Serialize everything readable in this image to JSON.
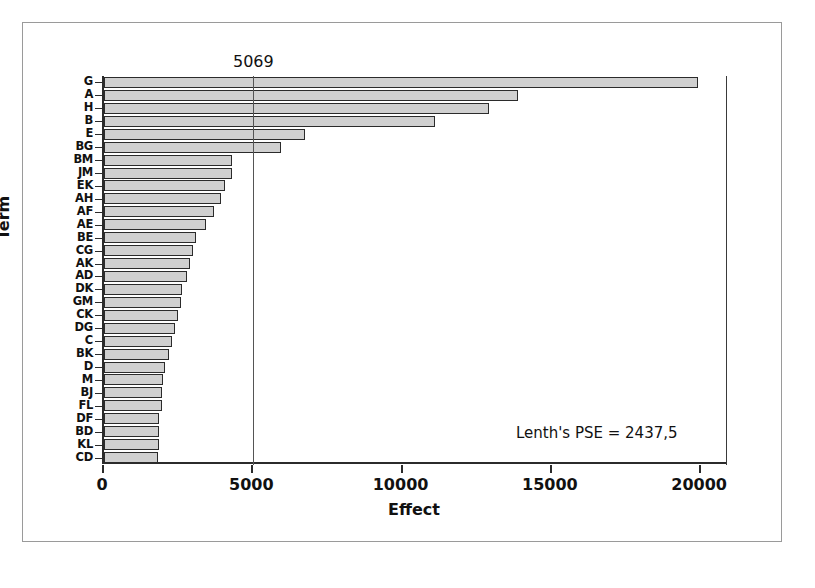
{
  "figure": {
    "x_axis_title": "Effect",
    "y_axis_title": "Term",
    "reference_line_label": "5069",
    "pse_annotation": "Lenth's PSE = 2437,5"
  },
  "chart_data": {
    "type": "bar",
    "orientation": "horizontal",
    "title": "",
    "xlabel": "Effect",
    "ylabel": "Term",
    "xlim": [
      0,
      20900
    ],
    "xticks": [
      0,
      5000,
      10000,
      15000,
      20000
    ],
    "xtick_labels": [
      "0",
      "5000",
      "10000",
      "15000",
      "20000"
    ],
    "grid": false,
    "legend": null,
    "reference_line": {
      "value": 5069,
      "label": "5069",
      "orientation": "vertical"
    },
    "annotations": [
      {
        "text": "Lenth's PSE = 2437,5",
        "x": 15000,
        "y": "bottom-right"
      }
    ],
    "categories": [
      "G",
      "A",
      "H",
      "B",
      "E",
      "BG",
      "BM",
      "JM",
      "EK",
      "AH",
      "AF",
      "AE",
      "BE",
      "CG",
      "AK",
      "AD",
      "DK",
      "GM",
      "CK",
      "DG",
      "C",
      "BK",
      "D",
      "M",
      "BJ",
      "FL",
      "DF",
      "BD",
      "KL",
      "CD"
    ],
    "values": [
      19900,
      13880,
      12880,
      11090,
      6730,
      5930,
      4300,
      4300,
      4040,
      3910,
      3690,
      3430,
      3080,
      2980,
      2880,
      2790,
      2600,
      2570,
      2470,
      2380,
      2280,
      2180,
      2050,
      1990,
      1950,
      1950,
      1850,
      1850,
      1850,
      1820
    ],
    "bar_fill_color": "#d0d0d0",
    "bar_edge_color": "#2b2b2b"
  },
  "colors": {
    "bar_fill": "#d0d0d0",
    "bar_edge": "#2b2b2b",
    "axis": "#2b2b2b",
    "reference_line": "#555555",
    "frame": "#9a9a9a",
    "background": "#ffffff"
  }
}
